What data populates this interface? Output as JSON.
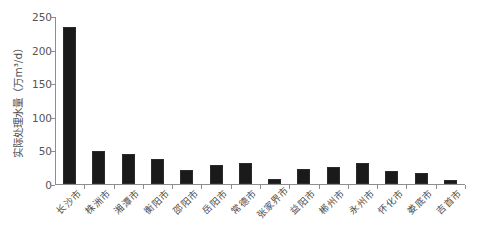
{
  "chart_data": {
    "type": "bar",
    "title": "",
    "subtitle": "",
    "xlabel": "",
    "ylabel": "实际处理水量（万m³/d）",
    "ylim": [
      0,
      250
    ],
    "yticks": [
      0,
      50,
      100,
      150,
      200,
      250
    ],
    "grid": false,
    "legend": "none",
    "bar_color": "#1a1a1a",
    "axis_color": "#8d8d8d",
    "categories": [
      "长沙市",
      "株洲市",
      "湘潭市",
      "衡阳市",
      "邵阳市",
      "岳阳市",
      "常德市",
      "张家界市",
      "益阳市",
      "郴州市",
      "永州市",
      "怀化市",
      "娄底市",
      "吉首市"
    ],
    "values": [
      235,
      49,
      45,
      37,
      21,
      28,
      31,
      7,
      22,
      25,
      32,
      19,
      16,
      6
    ],
    "units": "万m³/d"
  }
}
